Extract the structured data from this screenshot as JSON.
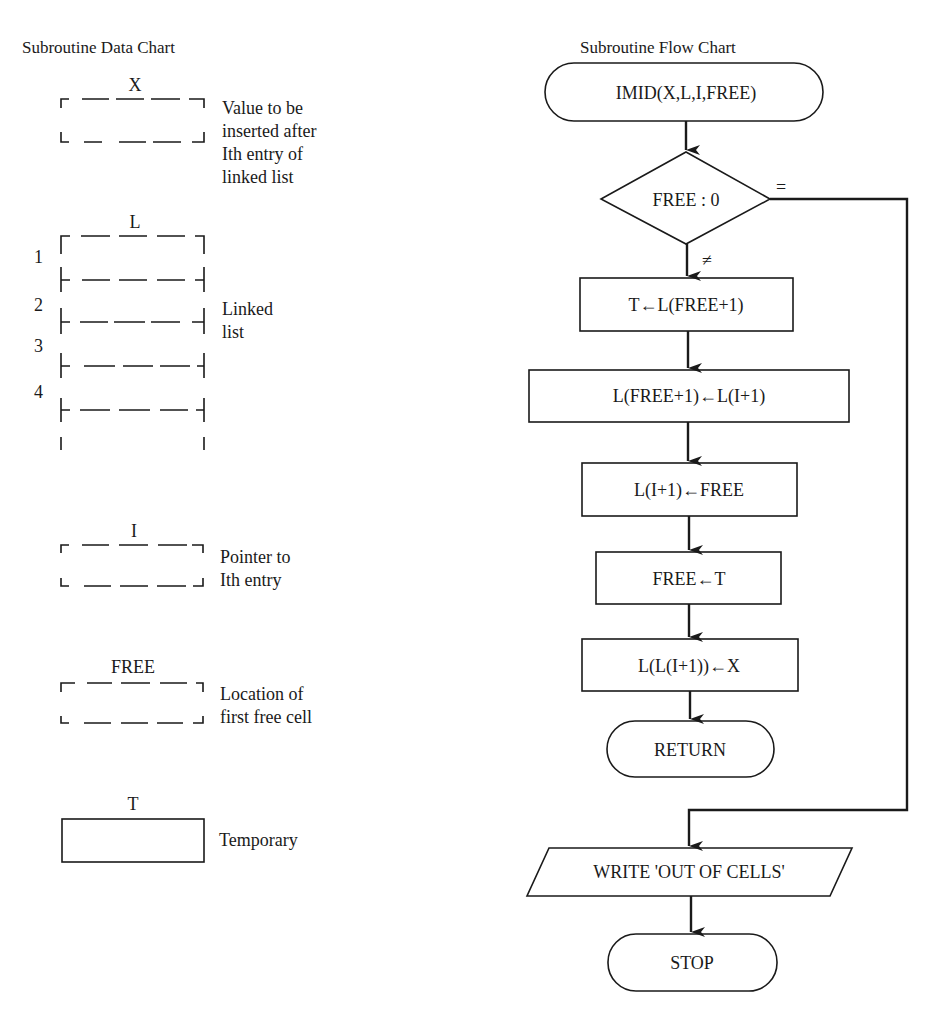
{
  "data_chart": {
    "title": "Subroutine Data Chart",
    "items": [
      {
        "name": "X",
        "description_lines": [
          "Value to be",
          "inserted after",
          "Ith entry of",
          "linked list"
        ],
        "style": "dashed"
      },
      {
        "name": "L",
        "description_lines": [
          "Linked",
          "list"
        ],
        "style": "dashed-list",
        "row_numbers": [
          "1",
          "2",
          "3",
          "4"
        ]
      },
      {
        "name": "I",
        "description_lines": [
          "Pointer to",
          "Ith entry"
        ],
        "style": "dashed"
      },
      {
        "name": "FREE",
        "description_lines": [
          "Location of",
          "first free cell"
        ],
        "style": "dashed"
      },
      {
        "name": "T",
        "description_lines": [
          "Temporary"
        ],
        "style": "solid"
      }
    ]
  },
  "flow_chart": {
    "title": "Subroutine Flow Chart",
    "nodes": {
      "start": {
        "type": "terminal",
        "label": "IMID(X,L,I,FREE)"
      },
      "decision": {
        "type": "decision",
        "label": "FREE : 0",
        "branch_equal": "=",
        "branch_not_equal": "≠"
      },
      "step1": {
        "type": "process",
        "label": "T←L(FREE+1)"
      },
      "step2": {
        "type": "process",
        "label": "L(FREE+1)←L(I+1)"
      },
      "step3": {
        "type": "process",
        "label": "L(I+1)←FREE"
      },
      "step4": {
        "type": "process",
        "label": "FREE←T"
      },
      "step5": {
        "type": "process",
        "label": "L(L(I+1))←X"
      },
      "return": {
        "type": "terminal",
        "label": "RETURN"
      },
      "write": {
        "type": "io",
        "label": "WRITE 'OUT OF CELLS'"
      },
      "stop": {
        "type": "terminal",
        "label": "STOP"
      }
    }
  }
}
